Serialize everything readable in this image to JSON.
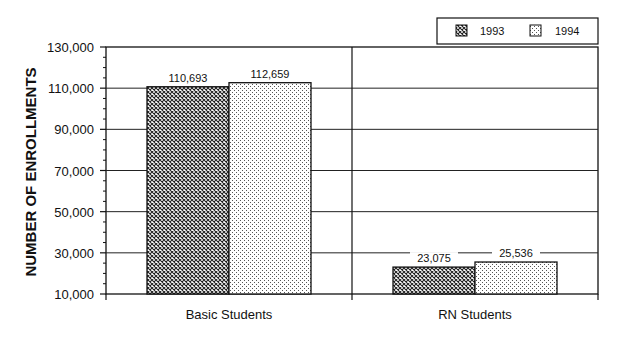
{
  "chart_data": {
    "type": "bar",
    "title": "",
    "xlabel": "",
    "ylabel": "NUMBER OF ENROLLMENTS",
    "categories": [
      "Basic Students",
      "RN Students"
    ],
    "series": [
      {
        "name": "1993",
        "values": [
          110693,
          23075
        ],
        "labels": [
          "110,693",
          "23,075"
        ],
        "pattern": "crosshatch"
      },
      {
        "name": "1994",
        "values": [
          112659,
          25536
        ],
        "labels": [
          "112,659",
          "25,536"
        ],
        "pattern": "dots"
      }
    ],
    "ylim": [
      10000,
      130000
    ],
    "yticks": [
      10000,
      30000,
      50000,
      70000,
      90000,
      110000,
      130000
    ],
    "ytick_labels": [
      "10,000",
      "30,000",
      "50,000",
      "70,000",
      "90,000",
      "110,000",
      "130,000"
    ],
    "grid": true,
    "legend_position": "top-right"
  },
  "legend": {
    "items": [
      {
        "label": "1993"
      },
      {
        "label": "1994"
      }
    ]
  }
}
